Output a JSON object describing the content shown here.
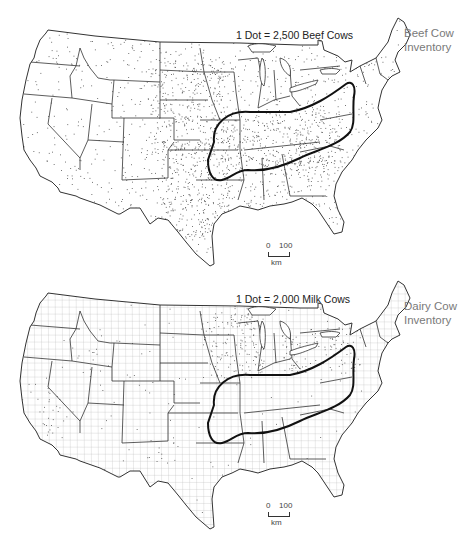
{
  "figure": {
    "panels": [
      {
        "id": "beef",
        "dot_legend": "1 Dot = 2,500 Beef Cows",
        "title_line1": "Beef Cow",
        "title_line2": "Inventory",
        "scale": {
          "start": "0",
          "end": "100",
          "unit": "km"
        },
        "dot_density": "high-central-plains-and-south",
        "county_lines": false
      },
      {
        "id": "dairy",
        "dot_legend": "1 Dot = 2,000 Milk Cows",
        "title_line1": "Dairy Cow",
        "title_line2": "Inventory",
        "scale": {
          "start": "0",
          "end": "100",
          "unit": "km"
        },
        "dot_density": "clustered-upper-midwest-california-northeast",
        "county_lines": true
      }
    ],
    "colors": {
      "border": "#333333",
      "dots": "#555555",
      "loop": "#111111",
      "title": "#7a7a7a",
      "legend": "#222222"
    }
  }
}
